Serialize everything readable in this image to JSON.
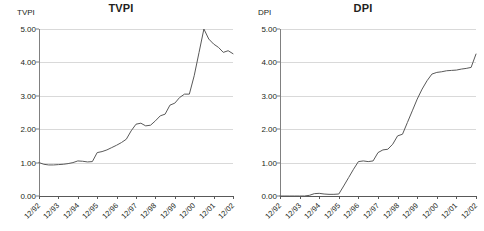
{
  "chart_data": [
    {
      "type": "line",
      "title": "TVPI",
      "ylabel": "TVPI",
      "xlabel": "",
      "ylim": [
        0,
        5
      ],
      "grid": true,
      "legend": "none",
      "ytick_labels": [
        "0.00",
        "1.00",
        "2.00",
        "3.00",
        "4.00",
        "5.00"
      ],
      "ytick_values": [
        0,
        1,
        2,
        3,
        4,
        5
      ],
      "categories": [
        "12/92",
        "12/93",
        "12/94",
        "12/95",
        "12/96",
        "12/97",
        "12/98",
        "12/99",
        "12/00",
        "12/01",
        "12/02"
      ],
      "x": [
        1992.0,
        1992.25,
        1992.5,
        1992.75,
        1993.0,
        1993.25,
        1993.5,
        1993.75,
        1994.0,
        1994.25,
        1994.5,
        1994.75,
        1995.0,
        1995.25,
        1995.5,
        1995.75,
        1996.0,
        1996.25,
        1996.5,
        1996.75,
        1997.0,
        1997.25,
        1997.5,
        1997.75,
        1998.0,
        1998.25,
        1998.5,
        1998.75,
        1999.0,
        1999.25,
        1999.5,
        1999.75,
        2000.0,
        2000.25,
        2000.5,
        2000.75,
        2001.0,
        2001.25,
        2001.5,
        2001.75,
        2002.0
      ],
      "values": [
        1.0,
        0.95,
        0.93,
        0.93,
        0.94,
        0.95,
        0.97,
        1.0,
        1.05,
        1.04,
        1.02,
        1.03,
        1.3,
        1.33,
        1.38,
        1.45,
        1.52,
        1.6,
        1.7,
        1.95,
        2.15,
        2.18,
        2.1,
        2.12,
        2.25,
        2.4,
        2.45,
        2.72,
        2.78,
        2.95,
        3.05,
        3.05,
        3.6,
        4.3,
        5.0,
        4.7,
        4.55,
        4.45,
        4.3,
        4.35,
        4.26
      ],
      "series_name": "TVPI"
    },
    {
      "type": "line",
      "title": "DPI",
      "ylabel": "DPI",
      "xlabel": "",
      "ylim": [
        0,
        5
      ],
      "grid": true,
      "legend": "none",
      "ytick_labels": [
        "0.00",
        "1.00",
        "2.00",
        "3.00",
        "4.00",
        "5.00"
      ],
      "ytick_values": [
        0,
        1,
        2,
        3,
        4,
        5
      ],
      "categories": [
        "12/92",
        "12/93",
        "12/94",
        "12/95",
        "12/96",
        "12/97",
        "12/98",
        "12/99",
        "12/00",
        "12/01",
        "12/02"
      ],
      "x": [
        1992.0,
        1992.25,
        1992.5,
        1992.75,
        1993.0,
        1993.25,
        1993.5,
        1993.75,
        1994.0,
        1994.25,
        1994.5,
        1994.75,
        1995.0,
        1995.25,
        1995.5,
        1995.75,
        1996.0,
        1996.25,
        1996.5,
        1996.75,
        1997.0,
        1997.25,
        1997.5,
        1997.75,
        1998.0,
        1998.25,
        1998.5,
        1998.75,
        1999.0,
        1999.25,
        1999.5,
        1999.75,
        2000.0,
        2000.25,
        2000.5,
        2000.75,
        2001.0,
        2001.25,
        2001.5,
        2001.75,
        2002.0
      ],
      "values": [
        0.0,
        0.0,
        0.0,
        0.0,
        0.0,
        0.0,
        0.02,
        0.07,
        0.08,
        0.06,
        0.05,
        0.05,
        0.06,
        0.3,
        0.55,
        0.8,
        1.03,
        1.05,
        1.03,
        1.05,
        1.3,
        1.38,
        1.4,
        1.55,
        1.8,
        1.85,
        2.2,
        2.55,
        2.9,
        3.2,
        3.45,
        3.65,
        3.7,
        3.72,
        3.75,
        3.76,
        3.77,
        3.8,
        3.82,
        3.85,
        4.25
      ],
      "series_name": "DPI"
    }
  ]
}
